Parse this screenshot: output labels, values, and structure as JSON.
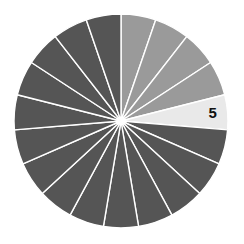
{
  "chart_data": {
    "type": "pie",
    "title": "",
    "slice_count": 19,
    "start_angle_deg": 0,
    "direction": "clockwise",
    "values": [
      1,
      1,
      1,
      1,
      1,
      1,
      1,
      1,
      1,
      1,
      1,
      1,
      1,
      1,
      1,
      1,
      1,
      1,
      1
    ],
    "categories": [
      "1",
      "2",
      "3",
      "4",
      "5",
      "6",
      "7",
      "8",
      "9",
      "10",
      "11",
      "12",
      "13",
      "14",
      "15",
      "16",
      "17",
      "18",
      "19"
    ],
    "highlighted_index": 4,
    "labels_shown": [
      {
        "index": 4,
        "text": "5"
      }
    ],
    "slice_states": [
      "completed",
      "completed",
      "completed",
      "completed",
      "current",
      "remaining",
      "remaining",
      "remaining",
      "remaining",
      "remaining",
      "remaining",
      "remaining",
      "remaining",
      "remaining",
      "remaining",
      "remaining",
      "remaining",
      "remaining",
      "remaining"
    ],
    "legend": null,
    "grid": false
  },
  "colors": {
    "completed": "#9a9a9a",
    "current": "#e9e9e9",
    "remaining": "#555555",
    "separator": "#ffffff",
    "label": "#111111",
    "background": "#ffffff"
  },
  "geometry": {
    "cx": 121,
    "cy": 121,
    "r": 107,
    "separator_width": 1.4
  }
}
